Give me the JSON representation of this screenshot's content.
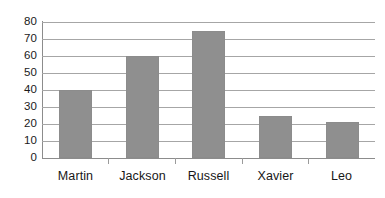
{
  "chart_data": {
    "type": "bar",
    "title": "",
    "subtitle": "",
    "xlabel": "",
    "ylabel": "",
    "categories": [
      "Martin",
      "Jackson",
      "Russell",
      "Xavier",
      "Leo"
    ],
    "values": [
      40,
      60,
      75,
      25,
      21
    ],
    "ylim": [
      0,
      80
    ],
    "ytick_labels": [
      "80",
      "70",
      "60",
      "50",
      "40",
      "30",
      "20",
      "10",
      "0"
    ],
    "ytick_values": [
      80,
      70,
      60,
      50,
      40,
      30,
      20,
      10,
      0
    ],
    "ytick_step": 10,
    "grid": "horizontal",
    "legend": "none",
    "annotations": [],
    "colors": {
      "bar": "#8f8f8f",
      "gridline": "#a6a6a6",
      "axis": "#8c8c8c",
      "tick_mark": "#9b9b9b",
      "label_text": "#171717",
      "background": "#ffffff"
    }
  }
}
